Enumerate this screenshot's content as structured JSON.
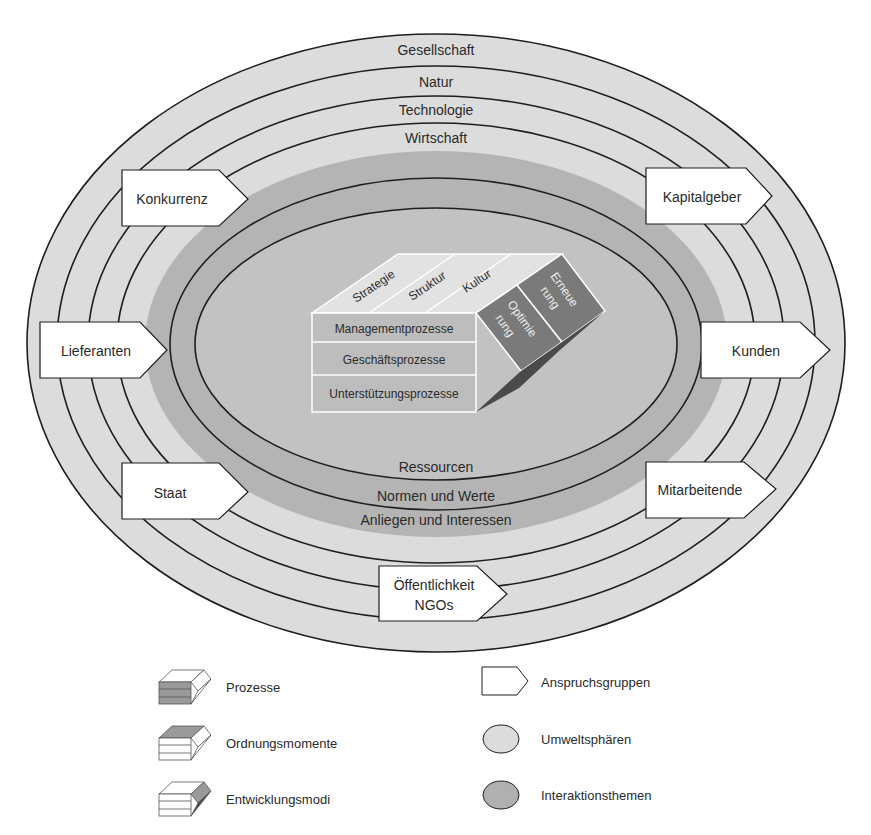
{
  "diagram": {
    "rings": {
      "umweltsphaeren": [
        "Gesellschaft",
        "Natur",
        "Technologie",
        "Wirtschaft"
      ],
      "interaktionsthemen": [
        "Ressourcen",
        "Normen und Werte",
        "Anliegen und Interessen"
      ]
    },
    "anspruchsgruppen": {
      "konkurrenz": "Konkurrenz",
      "kapitalgeber": "Kapitalgeber",
      "lieferanten": "Lieferanten",
      "kunden": "Kunden",
      "staat": "Staat",
      "mitarbeitende": "Mitarbeitende",
      "oeffentlichkeit_line1": "Öffentlichkeit",
      "oeffentlichkeit_line2": "NGOs"
    },
    "block": {
      "ordnungsmomente": [
        "Strategie",
        "Struktur",
        "Kultur"
      ],
      "prozesse": [
        "Managementprozesse",
        "Geschäftsprozesse",
        "Unterstützungsprozesse"
      ],
      "entwicklungsmodi": {
        "optimierung_line1": "Optimie",
        "optimierung_line2": "rung",
        "erneuerung_line1": "Erneue",
        "erneuerung_line2": "rung"
      }
    },
    "colors": {
      "umweltsphaeren_fill": "#dcdcdc",
      "interaktionsthemen_fill": "#b4b4b4",
      "core_fill": "#c0c0c0",
      "block_light": "#e4e4e4",
      "block_mid": "#bdbdbd",
      "block_dark": "#7a7a7a",
      "line": "#1e1e1e"
    }
  },
  "legend": {
    "left": [
      "Prozesse",
      "Ordnungsmomente",
      "Entwicklungsmodi"
    ],
    "right": [
      "Anspruchsgruppen",
      "Umweltsphären",
      "Interaktionsthemen"
    ]
  }
}
